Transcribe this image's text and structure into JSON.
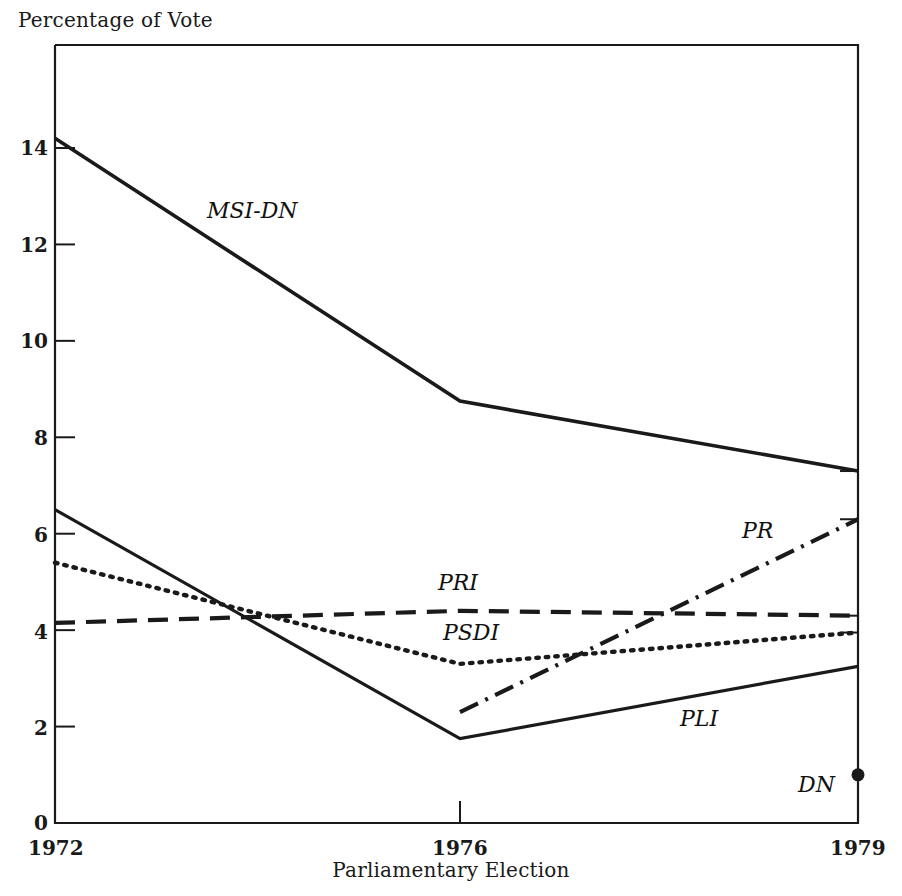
{
  "chart_data": {
    "type": "line",
    "title": "",
    "ylabel": "Percentage of Vote",
    "xlabel": "Parliamentary Election",
    "categories": [
      "1972",
      "1976",
      "1979"
    ],
    "x": [
      1972,
      1976,
      1979
    ],
    "xlim": [
      1972,
      1979
    ],
    "ylim": [
      0,
      15
    ],
    "yticks": [
      0,
      2,
      4,
      6,
      8,
      10,
      12,
      14
    ],
    "ytick_labels": [
      "0",
      "2",
      "4",
      "6",
      "8",
      "10",
      "12",
      "14"
    ],
    "xticks": [
      1972,
      1976,
      1979
    ],
    "xtick_labels": [
      "1972",
      "1976",
      "1979"
    ],
    "grid": false,
    "legend": "inline-labels",
    "series": [
      {
        "name": "MSI-DN",
        "style": "solid",
        "label_text": "MSI-DN",
        "x": [
          1972,
          1976,
          1979
        ],
        "values": [
          14.2,
          8.75,
          7.3
        ]
      },
      {
        "name": "PLI",
        "style": "solid",
        "label_text": "PLI",
        "x": [
          1972,
          1976,
          1979
        ],
        "values": [
          6.5,
          1.75,
          3.25
        ]
      },
      {
        "name": "PSDI",
        "style": "dotted",
        "label_text": "PSDI",
        "x": [
          1972,
          1976,
          1979
        ],
        "values": [
          5.4,
          3.3,
          3.95
        ]
      },
      {
        "name": "PRI",
        "style": "dashed",
        "label_text": "PRI",
        "x": [
          1972,
          1976,
          1979
        ],
        "values": [
          4.15,
          4.4,
          4.3
        ]
      },
      {
        "name": "PR",
        "style": "dash-dot",
        "label_text": "PR",
        "x": [
          1976,
          1979
        ],
        "values": [
          2.3,
          6.3
        ]
      },
      {
        "name": "DN",
        "style": "point",
        "label_text": "DN",
        "x": [
          1979
        ],
        "values": [
          1.0
        ]
      }
    ]
  },
  "axes": {
    "ylabel": "Percentage of Vote",
    "xlabel": "Parliamentary Election",
    "ytick_labels": [
      "0",
      "2",
      "4",
      "6",
      "8",
      "10",
      "12",
      "14"
    ],
    "xtick_labels": [
      "1972",
      "1976",
      "1979"
    ]
  },
  "series_labels": {
    "msi_dn": "MSI-DN",
    "pri": "PRI",
    "psdi": "PSDI",
    "pr": "PR",
    "pli": "PLI",
    "dn": "DN"
  },
  "colors": {
    "ink": "#1a1a1a",
    "background": "#ffffff"
  }
}
